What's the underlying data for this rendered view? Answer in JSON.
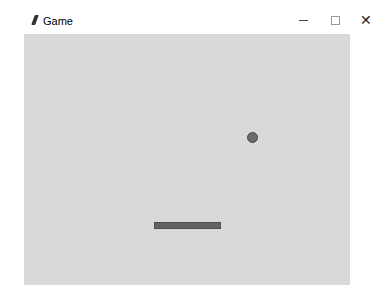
{
  "window": {
    "title": "Game",
    "icon": "feather-icon",
    "controls": {
      "minimize": "—",
      "maximize": "□",
      "close": "✕"
    }
  },
  "game": {
    "background": "#d9d9d9",
    "ball": {
      "x": 247,
      "y": 132,
      "diameter": 11,
      "color": "#6a6a6a"
    },
    "paddle": {
      "x": 154,
      "y": 222,
      "width": 67,
      "height": 7,
      "color": "#636363"
    }
  }
}
